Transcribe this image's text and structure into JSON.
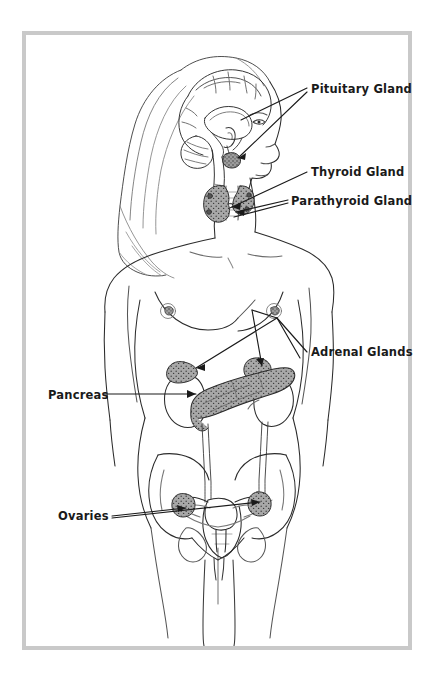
{
  "diagram": {
    "frame_color": "#c9c9c9",
    "background_color": "#ffffff",
    "line_color": "#2b2b2b",
    "gland_fill_color": "#9d9d9d",
    "label_color": "#1a1a1a"
  },
  "labels": {
    "pituitary": "Pituitary Gland",
    "thyroid": "Thyroid Gland",
    "parathyroid": "Parathyroid Gland",
    "adrenal": "Adrenal Glands",
    "pancreas": "Pancreas",
    "ovaries": "Ovaries"
  },
  "organs": [
    {
      "name": "pituitary-gland",
      "label": "Pituitary Gland",
      "region": "brain-base",
      "shaded": true
    },
    {
      "name": "thyroid-gland",
      "label": "Thyroid Gland",
      "region": "neck",
      "shaded": true
    },
    {
      "name": "parathyroid-gland",
      "label": "Parathyroid Gland",
      "region": "neck",
      "shaded": true
    },
    {
      "name": "adrenal-glands",
      "label": "Adrenal Glands",
      "region": "above-kidneys",
      "shaded": true,
      "count": 2
    },
    {
      "name": "pancreas",
      "label": "Pancreas",
      "region": "upper-abdomen",
      "shaded": true
    },
    {
      "name": "ovaries",
      "label": "Ovaries",
      "region": "pelvis",
      "shaded": true,
      "count": 2
    }
  ]
}
